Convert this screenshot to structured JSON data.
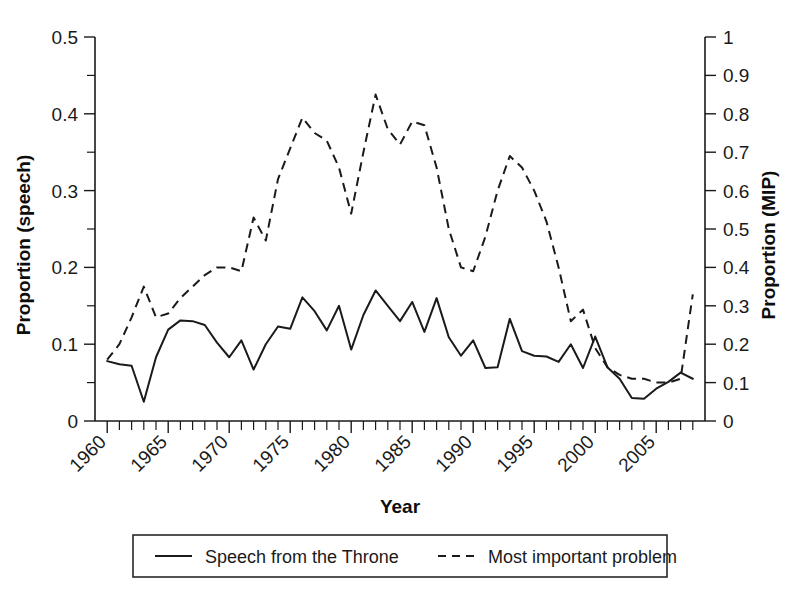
{
  "chart_data": {
    "type": "line",
    "title": "",
    "xlabel": "Year",
    "ylabel": "Proportion (speech)",
    "ylabel_right": "Proportion (MIP)",
    "xlim": [
      1959,
      2009
    ],
    "ylim": [
      0,
      0.5
    ],
    "ylim_right": [
      0,
      1
    ],
    "grid": false,
    "legend_position": "bottom",
    "x_tick_labels": [
      "1960",
      "1965",
      "1970",
      "1975",
      "1980",
      "1985",
      "1990",
      "1995",
      "2000",
      "2005"
    ],
    "x_tick_values": [
      1960,
      1965,
      1970,
      1975,
      1980,
      1985,
      1990,
      1995,
      2000,
      2005
    ],
    "y_tick_labels": [
      "0",
      "0.1",
      "0.2",
      "0.3",
      "0.4",
      "0.5"
    ],
    "y_tick_values": [
      0,
      0.1,
      0.2,
      0.3,
      0.4,
      0.5
    ],
    "y_right_tick_labels": [
      "0",
      "0.1",
      "0.2",
      "0.3",
      "0.4",
      "0.5",
      "0.6",
      "0.7",
      "0.8",
      "0.9",
      "1"
    ],
    "y_right_tick_values": [
      0,
      0.1,
      0.2,
      0.3,
      0.4,
      0.5,
      0.6,
      0.7,
      0.8,
      0.9,
      1
    ],
    "x": [
      1960,
      1961,
      1962,
      1963,
      1964,
      1965,
      1966,
      1967,
      1968,
      1969,
      1970,
      1971,
      1972,
      1973,
      1974,
      1975,
      1976,
      1977,
      1978,
      1979,
      1980,
      1981,
      1982,
      1983,
      1984,
      1985,
      1986,
      1987,
      1988,
      1989,
      1990,
      1991,
      1992,
      1993,
      1994,
      1995,
      1996,
      1997,
      1998,
      1999,
      2000,
      2001,
      2002,
      2003,
      2004,
      2005,
      2006,
      2007,
      2008
    ],
    "series": [
      {
        "name": "Speech from the Throne",
        "style": "solid",
        "axis": "left",
        "values": [
          0.078,
          0.074,
          0.072,
          0.025,
          0.083,
          0.119,
          0.131,
          0.13,
          0.125,
          0.102,
          0.083,
          0.105,
          0.067,
          0.1,
          0.123,
          0.12,
          0.161,
          0.143,
          0.118,
          0.15,
          0.093,
          0.138,
          0.17,
          0.15,
          0.13,
          0.155,
          0.116,
          0.16,
          0.109,
          0.085,
          0.105,
          0.069,
          0.07,
          0.133,
          0.091,
          0.085,
          0.084,
          0.077,
          0.1,
          0.069,
          0.11,
          0.07,
          0.055,
          0.03,
          0.029,
          0.042,
          0.051,
          0.063,
          0.055
        ],
        "axis_label": "Proportion (speech)"
      },
      {
        "name": "Most important problem",
        "style": "dashed",
        "axis": "right",
        "values": [
          0.16,
          0.2,
          0.27,
          0.35,
          0.27,
          0.28,
          0.32,
          0.35,
          0.38,
          0.4,
          0.4,
          0.39,
          0.53,
          0.47,
          0.63,
          0.71,
          0.79,
          0.75,
          0.73,
          0.66,
          0.54,
          0.7,
          0.85,
          0.76,
          0.72,
          0.78,
          0.77,
          0.66,
          0.5,
          0.4,
          0.39,
          0.48,
          0.6,
          0.69,
          0.66,
          0.6,
          0.52,
          0.4,
          0.26,
          0.29,
          0.19,
          0.14,
          0.12,
          0.11,
          0.11,
          0.1,
          0.1,
          0.11,
          0.33
        ],
        "axis_label": "Proportion (MIP)"
      }
    ]
  },
  "legend": {
    "items": [
      {
        "label": "Speech from the Throne",
        "style": "solid"
      },
      {
        "label": "Most important problem",
        "style": "dashed"
      }
    ]
  },
  "axes": {
    "x_title": "Year",
    "y_left_title": "Proportion (speech)",
    "y_right_title": "Proportion (MIP)"
  }
}
